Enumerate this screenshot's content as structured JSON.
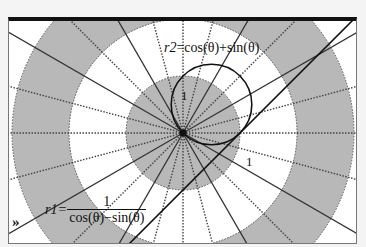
{
  "chart_data": {
    "type": "line",
    "title": "",
    "coordinate_system": "polar",
    "xlabel": "",
    "ylabel": "",
    "grid": {
      "rings": [
        1,
        2,
        3
      ],
      "ring_fill": [
        "#b8b8b8",
        "#ffffff",
        "#b8b8b8"
      ],
      "radial_dotted_step_deg": 15,
      "radial_solid_step_deg": 30
    },
    "series": [
      {
        "name": "r1",
        "equation": "r1 = 1/(cos(θ) − sin(θ))",
        "shape": "line y = x − 1",
        "points": [
          [
            1,
            0
          ],
          [
            0,
            -1
          ],
          [
            2,
            1
          ],
          [
            3,
            2
          ],
          [
            -1,
            -2
          ]
        ]
      },
      {
        "name": "r2",
        "equation": "r2 = cos(θ) + sin(θ)",
        "shape": "circle center (0.5, 0.5), radius 0.7071",
        "points": [
          [
            0,
            0
          ],
          [
            1,
            0
          ],
          [
            0,
            1
          ],
          [
            1,
            1
          ]
        ]
      }
    ],
    "tick_labels": [
      {
        "text": "1",
        "at": [
          0,
          1
        ]
      },
      {
        "text": "1",
        "at": [
          1,
          0
        ]
      }
    ],
    "xlim": [
      -3.05,
      3.05
    ],
    "ylim": [
      -2.0,
      2.0
    ]
  },
  "labels": {
    "r2_name": "r2",
    "r2_expr": "=cos(θ)+sin(θ)",
    "r1_name": "r1",
    "r1_eq": "=",
    "r1_num": "1",
    "r1_den": "cos(θ)−sin(θ)",
    "one_y": "1",
    "one_x": "1"
  },
  "controls": {
    "expand_icon": "»"
  },
  "colors": {
    "ring_gray": "#b8b8b8",
    "curve": "#111111",
    "frame_top": "#111111"
  }
}
